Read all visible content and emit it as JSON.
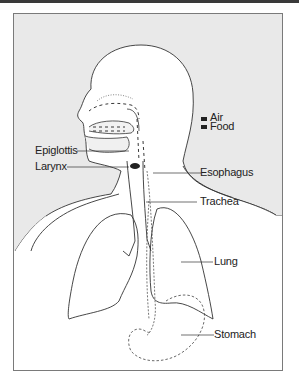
{
  "diagram": {
    "type": "anatomical-illustration",
    "legend": [
      {
        "label": "Air",
        "swatch": "#222222"
      },
      {
        "label": "Food",
        "swatch": "#222222"
      }
    ],
    "labels": {
      "epiglottis": "Epiglottis",
      "larynx": "Larynx",
      "esophagus": "Esophagus",
      "trachea": "Trachea",
      "lung": "Lung",
      "stomach": "Stomach"
    },
    "colors": {
      "background": "#e9e9e9",
      "silhouette": "#ffffff",
      "line": "#333333",
      "frame": "#7a7a7a"
    }
  }
}
